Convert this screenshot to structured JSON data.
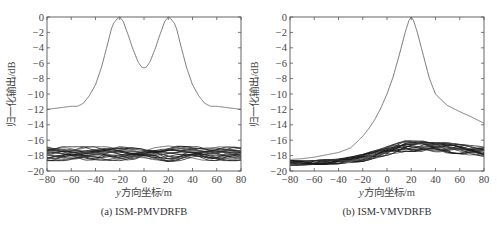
{
  "chart_data": [
    {
      "type": "line",
      "caption": "(a) ISM-PMVDRFB",
      "xlabel_italic": "y",
      "xlabel": "方向坐标/m",
      "ylabel": "归一化输出/dB",
      "xlim": [
        -80,
        80
      ],
      "ylim": [
        -20,
        0
      ],
      "xticks": [
        -80,
        -60,
        -40,
        -20,
        0,
        20,
        40,
        60,
        80
      ],
      "yticks": [
        0,
        -2,
        -4,
        -6,
        -8,
        -10,
        -12,
        -14,
        -16,
        -18,
        -20
      ],
      "grid": false,
      "series": [
        {
          "name": "main beam",
          "x": [
            -80,
            -70,
            -60,
            -55,
            -50,
            -45,
            -40,
            -35,
            -30,
            -27,
            -25,
            -22,
            -20,
            -17,
            -15,
            -12,
            -10,
            -7,
            -5,
            -2,
            0,
            2,
            5,
            7,
            10,
            12,
            15,
            17,
            20,
            22,
            25,
            27,
            30,
            35,
            40,
            45,
            50,
            55,
            60,
            70,
            80
          ],
          "y": [
            -12,
            -11.8,
            -11.6,
            -11.6,
            -11.2,
            -10.2,
            -8.8,
            -6.5,
            -3.5,
            -1.6,
            -0.8,
            -0.2,
            0,
            -0.6,
            -1.5,
            -2.8,
            -3.8,
            -5,
            -5.8,
            -6.5,
            -6.6,
            -6.5,
            -5.8,
            -5,
            -3.8,
            -2.8,
            -1.5,
            -0.6,
            0,
            -0.2,
            -0.8,
            -1.6,
            -3.5,
            -6.5,
            -8.8,
            -10.2,
            -11.2,
            -11.6,
            -11.6,
            -11.8,
            -12
          ]
        },
        {
          "name": "interference band (multiple overlapping curves)",
          "x": [
            -80,
            -60,
            -40,
            -20,
            0,
            20,
            40,
            60,
            80
          ],
          "y_upper": [
            -17.0,
            -17.0,
            -17.0,
            -17.0,
            -17.3,
            -16.9,
            -17.0,
            -17.0,
            -17.1
          ],
          "y_lower": [
            -18.5,
            -18.5,
            -18.4,
            -18.5,
            -18.2,
            -18.6,
            -18.4,
            -18.5,
            -18.5
          ]
        }
      ]
    },
    {
      "type": "line",
      "caption": "(b) ISM-VMVDRFB",
      "xlabel_italic": "y",
      "xlabel": "方向坐标/m",
      "ylabel": "归一化输出/dB",
      "xlim": [
        -80,
        80
      ],
      "ylim": [
        -20,
        0
      ],
      "xticks": [
        -80,
        -60,
        -40,
        -20,
        0,
        20,
        40,
        60,
        80
      ],
      "yticks": [
        0,
        -2,
        -4,
        -6,
        -8,
        -10,
        -12,
        -14,
        -16,
        -18,
        -20
      ],
      "grid": false,
      "series": [
        {
          "name": "main beam",
          "x": [
            -80,
            -70,
            -60,
            -50,
            -40,
            -30,
            -20,
            -15,
            -10,
            -5,
            0,
            5,
            10,
            15,
            18,
            20,
            22,
            25,
            30,
            35,
            40,
            45,
            50,
            60,
            70,
            80
          ],
          "y": [
            -18.5,
            -18.4,
            -18.2,
            -17.9,
            -17.6,
            -17.0,
            -15.5,
            -14.5,
            -13.3,
            -11.8,
            -10.0,
            -7.8,
            -5.0,
            -2.0,
            -0.5,
            0,
            -0.5,
            -2.0,
            -5.0,
            -8.0,
            -10.0,
            -10.8,
            -11.5,
            -12.3,
            -13.0,
            -13.8
          ]
        },
        {
          "name": "interference band (multiple overlapping curves)",
          "x": [
            -80,
            -60,
            -40,
            -20,
            0,
            15,
            30,
            40,
            60,
            80
          ],
          "y_upper": [
            -18.8,
            -18.8,
            -18.6,
            -18.0,
            -17.0,
            -16.2,
            -16.0,
            -16.3,
            -16.7,
            -17.0
          ],
          "y_lower": [
            -19.1,
            -19.0,
            -18.9,
            -18.6,
            -17.8,
            -17.3,
            -17.3,
            -17.4,
            -17.6,
            -18.0
          ]
        }
      ]
    }
  ],
  "figure": {
    "panels": [
      {
        "caption": "(a) ISM-PMVDRFB",
        "xlabel_italic": "y",
        "xlabel": "方向坐标/m",
        "ylabel": "归一化输出/dB"
      },
      {
        "caption": "(b) ISM-VMVDRFB",
        "xlabel_italic": "y",
        "xlabel": "方向坐标/m",
        "ylabel": "归一化输出/dB"
      }
    ],
    "colors": {
      "axis": "#555555",
      "line": "#6a6a6a",
      "band": "#1a1a1a"
    }
  }
}
